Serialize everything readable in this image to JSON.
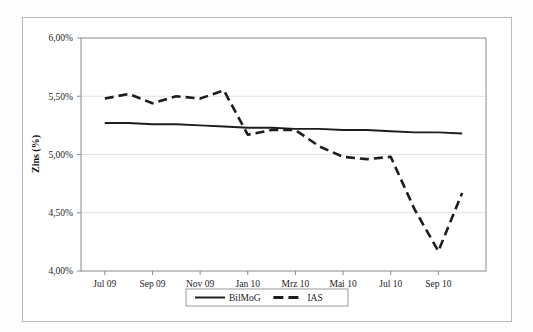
{
  "figure": {
    "background_color": "#fdfdfd",
    "frame_color": "#b9b9b9",
    "plot_border_color": "#8a8a8a",
    "grid_color": "#e2e2e2",
    "series_color": "#1d1d1d"
  },
  "axis": {
    "y_title": "Zins (%)",
    "y_ticks": [
      "6,00%",
      "5,50%",
      "5,00%",
      "4,50%",
      "4,00%"
    ],
    "x_ticks": [
      "Jul 09",
      "Sep 09",
      "Nov 09",
      "Jan 10",
      "Mrz 10",
      "Mai 10",
      "Jul 10",
      "Sep 10"
    ]
  },
  "legend": {
    "items": [
      {
        "label": "BilMoG",
        "style": "solid"
      },
      {
        "label": "IAS",
        "style": "dashed"
      }
    ]
  },
  "chart_data": {
    "type": "line",
    "title": "",
    "xlabel": "",
    "ylabel": "Zins (%)",
    "ylim": [
      4.0,
      6.0
    ],
    "ytick_values": [
      6.0,
      5.5,
      5.0,
      4.5,
      4.0
    ],
    "ytick_labels": [
      "6,00%",
      "5,50%",
      "5,00%",
      "4,50%",
      "4,00%"
    ],
    "grid": true,
    "legend_position": "bottom",
    "x": [
      "Jul 09",
      "Aug 09",
      "Sep 09",
      "Oct 09",
      "Nov 09",
      "Dec 09",
      "Jan 10",
      "Feb 10",
      "Mrz 10",
      "Apr 10",
      "Mai 10",
      "Jun 10",
      "Jul 10",
      "Aug 10",
      "Sep 10",
      "Oct 10"
    ],
    "xtick_labels": [
      "Jul 09",
      "Sep 09",
      "Nov 09",
      "Jan 10",
      "Mrz 10",
      "Mai 10",
      "Jul 10",
      "Sep 10"
    ],
    "series": [
      {
        "name": "BilMoG",
        "style": "solid",
        "values": [
          5.27,
          5.27,
          5.26,
          5.26,
          5.25,
          5.24,
          5.23,
          5.23,
          5.22,
          5.22,
          5.21,
          5.21,
          5.2,
          5.19,
          5.19,
          5.18
        ]
      },
      {
        "name": "IAS",
        "style": "dashed",
        "values": [
          5.48,
          5.52,
          5.44,
          5.5,
          5.48,
          5.55,
          5.17,
          5.21,
          5.21,
          5.07,
          4.98,
          4.96,
          4.98,
          4.53,
          4.17,
          4.67
        ]
      }
    ]
  }
}
